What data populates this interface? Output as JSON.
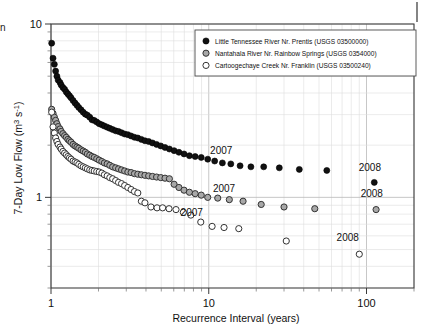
{
  "chart_data": {
    "type": "scatter",
    "title": "",
    "xlabel": "Recurrence Interval (years)",
    "ylabel": "7-Day Low Flow (m3 s-1)",
    "ylabel_display": "7-Day Low Flow (m³ s⁻¹)",
    "xscale": "log",
    "yscale": "log",
    "xlim": [
      1,
      200
    ],
    "ylim": [
      0.3,
      10
    ],
    "xticks": [
      1,
      10,
      100
    ],
    "xticklabels": [
      "1",
      "10",
      "100"
    ],
    "yticks": [
      1,
      10
    ],
    "yticklabels": [
      "1",
      "10"
    ],
    "grid": "both-log-minor",
    "legend_position": "upper-right-inside",
    "series": [
      {
        "name": "Little Tennessee River Nr. Prentis (USGS 03500000)",
        "marker": "filled-circle",
        "color": "#000000",
        "fill": "#111111",
        "points": [
          [
            1.01,
            7.75
          ],
          [
            1.03,
            6.35
          ],
          [
            1.05,
            5.85
          ],
          [
            1.07,
            5.35
          ],
          [
            1.09,
            5.0
          ],
          [
            1.11,
            4.75
          ],
          [
            1.14,
            4.6
          ],
          [
            1.16,
            4.45
          ],
          [
            1.19,
            4.3
          ],
          [
            1.22,
            4.2
          ],
          [
            1.25,
            4.05
          ],
          [
            1.28,
            3.95
          ],
          [
            1.31,
            3.85
          ],
          [
            1.34,
            3.75
          ],
          [
            1.38,
            3.62
          ],
          [
            1.42,
            3.5
          ],
          [
            1.46,
            3.4
          ],
          [
            1.5,
            3.3
          ],
          [
            1.55,
            3.2
          ],
          [
            1.6,
            3.1
          ],
          [
            1.65,
            3.02
          ],
          [
            1.7,
            2.98
          ],
          [
            1.76,
            2.9
          ],
          [
            1.82,
            2.8
          ],
          [
            1.88,
            2.78
          ],
          [
            1.95,
            2.72
          ],
          [
            2.02,
            2.66
          ],
          [
            2.1,
            2.62
          ],
          [
            2.18,
            2.58
          ],
          [
            2.27,
            2.54
          ],
          [
            2.36,
            2.5
          ],
          [
            2.46,
            2.46
          ],
          [
            2.57,
            2.42
          ],
          [
            2.68,
            2.4
          ],
          [
            2.8,
            2.36
          ],
          [
            2.93,
            2.32
          ],
          [
            3.07,
            2.3
          ],
          [
            3.22,
            2.26
          ],
          [
            3.38,
            2.22
          ],
          [
            3.55,
            2.2
          ],
          [
            3.74,
            2.16
          ],
          [
            3.94,
            2.12
          ],
          [
            4.16,
            2.1
          ],
          [
            4.4,
            2.06
          ],
          [
            4.67,
            2.02
          ],
          [
            4.96,
            1.98
          ],
          [
            5.28,
            1.94
          ],
          [
            5.63,
            1.9
          ],
          [
            6.03,
            1.86
          ],
          [
            6.47,
            1.82
          ],
          [
            6.97,
            1.78
          ],
          [
            7.54,
            1.74
          ],
          [
            8.2,
            1.72
          ],
          [
            8.96,
            1.7
          ],
          [
            9.85,
            1.66
          ],
          [
            10.9,
            1.62
          ],
          [
            12.2,
            1.58
          ],
          [
            13.8,
            1.56
          ],
          [
            15.8,
            1.52
          ],
          [
            18.5,
            1.5
          ],
          [
            22.3,
            1.5
          ],
          [
            28.0,
            1.48
          ],
          [
            37.5,
            1.45
          ],
          [
            56.0,
            1.43
          ],
          [
            112.0,
            1.22
          ]
        ]
      },
      {
        "name": "Nantahala River Nr. Rainbow Springs (USGS 0354000)",
        "marker": "gray-circle",
        "color": "#333333",
        "fill": "#a8a8a8",
        "points": [
          [
            1.01,
            3.22
          ],
          [
            1.03,
            3.05
          ],
          [
            1.05,
            2.9
          ],
          [
            1.07,
            2.78
          ],
          [
            1.09,
            2.66
          ],
          [
            1.11,
            2.56
          ],
          [
            1.14,
            2.48
          ],
          [
            1.16,
            2.4
          ],
          [
            1.19,
            2.33
          ],
          [
            1.22,
            2.27
          ],
          [
            1.25,
            2.22
          ],
          [
            1.28,
            2.16
          ],
          [
            1.31,
            2.12
          ],
          [
            1.34,
            2.08
          ],
          [
            1.38,
            2.02
          ],
          [
            1.42,
            1.98
          ],
          [
            1.46,
            1.95
          ],
          [
            1.5,
            1.92
          ],
          [
            1.55,
            1.88
          ],
          [
            1.6,
            1.85
          ],
          [
            1.65,
            1.82
          ],
          [
            1.7,
            1.78
          ],
          [
            1.76,
            1.75
          ],
          [
            1.82,
            1.72
          ],
          [
            1.88,
            1.7
          ],
          [
            1.95,
            1.67
          ],
          [
            2.02,
            1.64
          ],
          [
            2.1,
            1.61
          ],
          [
            2.18,
            1.58
          ],
          [
            2.27,
            1.56
          ],
          [
            2.36,
            1.53
          ],
          [
            2.46,
            1.5
          ],
          [
            2.57,
            1.48
          ],
          [
            2.68,
            1.46
          ],
          [
            2.8,
            1.44
          ],
          [
            2.93,
            1.42
          ],
          [
            3.07,
            1.4
          ],
          [
            3.22,
            1.39
          ],
          [
            3.38,
            1.37
          ],
          [
            3.55,
            1.36
          ],
          [
            3.74,
            1.35
          ],
          [
            3.94,
            1.34
          ],
          [
            4.16,
            1.33
          ],
          [
            4.4,
            1.32
          ],
          [
            4.67,
            1.31
          ],
          [
            4.96,
            1.3
          ],
          [
            5.28,
            1.29
          ],
          [
            5.63,
            1.28
          ],
          [
            6.03,
            1.19
          ],
          [
            6.47,
            1.14
          ],
          [
            6.97,
            1.1
          ],
          [
            7.54,
            1.07
          ],
          [
            8.2,
            1.05
          ],
          [
            8.96,
            1.03
          ],
          [
            9.85,
            1.0
          ],
          [
            11.4,
            0.99
          ],
          [
            13.5,
            0.97
          ],
          [
            16.5,
            0.95
          ],
          [
            21.5,
            0.91
          ],
          [
            30.0,
            0.88
          ],
          [
            47.0,
            0.86
          ],
          [
            115.0,
            0.85
          ]
        ]
      },
      {
        "name": "Cartoogechaye Creek Nr. Franklin (USGS 03500240)",
        "marker": "open-circle",
        "color": "#333333",
        "fill": "#ffffff",
        "points": [
          [
            1.01,
            3.1
          ],
          [
            1.03,
            2.55
          ],
          [
            1.05,
            2.35
          ],
          [
            1.07,
            2.2
          ],
          [
            1.09,
            2.1
          ],
          [
            1.11,
            2.02
          ],
          [
            1.14,
            1.95
          ],
          [
            1.16,
            1.9
          ],
          [
            1.19,
            1.84
          ],
          [
            1.22,
            1.8
          ],
          [
            1.25,
            1.76
          ],
          [
            1.28,
            1.72
          ],
          [
            1.31,
            1.69
          ],
          [
            1.34,
            1.66
          ],
          [
            1.38,
            1.62
          ],
          [
            1.42,
            1.6
          ],
          [
            1.46,
            1.58
          ],
          [
            1.5,
            1.55
          ],
          [
            1.55,
            1.52
          ],
          [
            1.6,
            1.5
          ],
          [
            1.65,
            1.48
          ],
          [
            1.7,
            1.46
          ],
          [
            1.76,
            1.44
          ],
          [
            1.82,
            1.43
          ],
          [
            1.88,
            1.42
          ],
          [
            1.95,
            1.41
          ],
          [
            2.02,
            1.4
          ],
          [
            2.1,
            1.38
          ],
          [
            2.18,
            1.35
          ],
          [
            2.27,
            1.33
          ],
          [
            2.36,
            1.3
          ],
          [
            2.46,
            1.28
          ],
          [
            2.57,
            1.25
          ],
          [
            2.68,
            1.22
          ],
          [
            2.8,
            1.2
          ],
          [
            2.93,
            1.17
          ],
          [
            3.07,
            1.14
          ],
          [
            3.22,
            1.11
          ],
          [
            3.38,
            1.08
          ],
          [
            3.55,
            1.06
          ],
          [
            3.74,
            0.95
          ],
          [
            3.94,
            0.93
          ],
          [
            4.3,
            0.88
          ],
          [
            4.7,
            0.87
          ],
          [
            5.1,
            0.87
          ],
          [
            5.6,
            0.86
          ],
          [
            6.2,
            0.85
          ],
          [
            6.9,
            0.82
          ],
          [
            7.7,
            0.79
          ],
          [
            8.9,
            0.72
          ],
          [
            10.5,
            0.68
          ],
          [
            12.5,
            0.67
          ],
          [
            15.5,
            0.66
          ],
          [
            31.0,
            0.56
          ],
          [
            90.0,
            0.47
          ]
        ]
      }
    ],
    "annotations": [
      {
        "text": "2007",
        "x": 12.0,
        "y": 1.78,
        "series": "Little Tennessee River Nr. Prentis (USGS 03500000)"
      },
      {
        "text": "2008",
        "x": 105.0,
        "y": 1.42,
        "series": "Little Tennessee River Nr. Prentis (USGS 03500000)"
      },
      {
        "text": "2007",
        "x": 12.5,
        "y": 1.07,
        "series": "Nantahala River Nr. Rainbow Springs (USGS 0354000)"
      },
      {
        "text": "2008",
        "x": 108.0,
        "y": 1.0,
        "series": "Nantahala River Nr. Rainbow Springs (USGS 0354000)"
      },
      {
        "text": "2007",
        "x": 7.8,
        "y": 0.78,
        "series": "Cartoogechaye Creek Nr. Franklin (USGS 03500240)"
      },
      {
        "text": "2008",
        "x": 76.0,
        "y": 0.56,
        "series": "Cartoogechaye Creek Nr. Franklin (USGS 03500240)"
      }
    ]
  },
  "artifacts": {
    "left_edge_fragment": "n"
  }
}
